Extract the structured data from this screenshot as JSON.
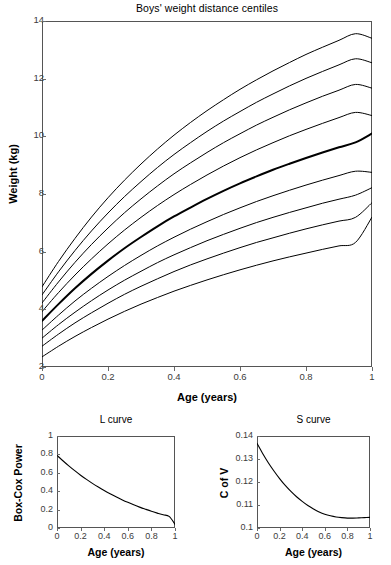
{
  "chart_data": [
    {
      "id": "main",
      "type": "line",
      "title": "Boys' weight distance centiles",
      "xlabel": "Age (years)",
      "ylabel": "Weight (kg)",
      "xlim": [
        0,
        1
      ],
      "ylim": [
        2,
        14
      ],
      "xticks": [
        0,
        0.2,
        0.4,
        0.6,
        0.8,
        1
      ],
      "xticklabels": [
        "0",
        "0.2",
        "0.4",
        "0.6",
        "0.8",
        "1"
      ],
      "yticks": [
        2,
        4,
        6,
        8,
        10,
        12,
        14
      ],
      "yticklabels": [
        "2",
        "4",
        "6",
        "8",
        "10",
        "12",
        "14"
      ],
      "grid": false,
      "legend": false,
      "x": [
        0,
        0.05,
        0.1,
        0.15,
        0.2,
        0.25,
        0.3,
        0.35,
        0.4,
        0.45,
        0.5,
        0.55,
        0.6,
        0.65,
        0.7,
        0.75,
        0.8,
        0.85,
        0.9,
        0.95,
        1
      ],
      "series": [
        {
          "name": "99.6th centile",
          "emphasis": false,
          "values": [
            4.78,
            5.66,
            6.46,
            7.2,
            7.87,
            8.48,
            9.04,
            9.56,
            10.04,
            10.48,
            10.89,
            11.27,
            11.63,
            11.96,
            12.27,
            12.56,
            12.84,
            13.09,
            13.33,
            13.56,
            13.4
          ]
        },
        {
          "name": "98th centile",
          "emphasis": false,
          "values": [
            4.5,
            5.3,
            6.04,
            6.72,
            7.34,
            7.91,
            8.43,
            8.92,
            9.37,
            9.78,
            10.17,
            10.53,
            10.86,
            11.18,
            11.47,
            11.75,
            12.01,
            12.25,
            12.48,
            12.69,
            12.55
          ]
        },
        {
          "name": "91st centile",
          "emphasis": false,
          "values": [
            4.22,
            4.95,
            5.63,
            6.25,
            6.82,
            7.35,
            7.83,
            8.28,
            8.7,
            9.08,
            9.44,
            9.78,
            10.09,
            10.39,
            10.66,
            10.92,
            11.16,
            11.39,
            11.6,
            11.8,
            11.67
          ]
        },
        {
          "name": "75th centile",
          "emphasis": false,
          "values": [
            3.92,
            4.58,
            5.19,
            5.75,
            6.27,
            6.75,
            7.19,
            7.6,
            7.98,
            8.33,
            8.66,
            8.97,
            9.26,
            9.53,
            9.78,
            10.02,
            10.24,
            10.45,
            10.65,
            10.83,
            10.72
          ]
        },
        {
          "name": "50th centile (median)",
          "emphasis": true,
          "values": [
            3.6,
            4.18,
            4.73,
            5.23,
            5.69,
            6.12,
            6.51,
            6.88,
            7.22,
            7.53,
            7.83,
            8.11,
            8.37,
            8.61,
            8.84,
            9.05,
            9.25,
            9.44,
            9.62,
            9.79,
            10.1
          ]
        },
        {
          "name": "25th centile",
          "emphasis": false,
          "values": [
            3.28,
            3.8,
            4.29,
            4.73,
            5.14,
            5.52,
            5.87,
            6.2,
            6.5,
            6.78,
            7.04,
            7.29,
            7.52,
            7.74,
            7.94,
            8.13,
            8.31,
            8.48,
            8.64,
            8.79,
            8.75
          ]
        },
        {
          "name": "9th centile",
          "emphasis": false,
          "values": [
            3.0,
            3.47,
            3.9,
            4.3,
            4.67,
            5.01,
            5.32,
            5.62,
            5.89,
            6.14,
            6.38,
            6.6,
            6.81,
            7.01,
            7.19,
            7.36,
            7.52,
            7.68,
            7.82,
            7.96,
            8.22
          ]
        },
        {
          "name": "2nd centile",
          "emphasis": false,
          "values": [
            2.72,
            3.14,
            3.53,
            3.88,
            4.21,
            4.52,
            4.8,
            5.06,
            5.31,
            5.54,
            5.75,
            5.95,
            6.14,
            6.32,
            6.48,
            6.64,
            6.79,
            6.93,
            7.06,
            7.19,
            7.7
          ]
        },
        {
          "name": "0.4th centile",
          "emphasis": false,
          "values": [
            2.35,
            2.72,
            3.06,
            3.37,
            3.66,
            3.93,
            4.18,
            4.41,
            4.63,
            4.83,
            5.02,
            5.2,
            5.37,
            5.53,
            5.68,
            5.82,
            5.95,
            6.08,
            6.2,
            6.32,
            7.2
          ]
        }
      ]
    },
    {
      "id": "l-curve",
      "type": "line",
      "title": "L curve",
      "xlabel": "Age (years)",
      "ylabel": "Box-Cox Power",
      "xlim": [
        0,
        1
      ],
      "ylim": [
        0,
        1
      ],
      "xticks": [
        0,
        0.2,
        0.4,
        0.6,
        0.8,
        1
      ],
      "xticklabels": [
        "0",
        "0.2",
        "0.4",
        "0.6",
        "0.8",
        "1"
      ],
      "yticks": [
        0,
        0.2,
        0.4,
        0.6,
        0.8,
        1
      ],
      "yticklabels": [
        "0",
        "0.2",
        "0.4",
        "0.6",
        "0.8",
        "1"
      ],
      "grid": false,
      "legend": false,
      "x": [
        0,
        0.05,
        0.1,
        0.15,
        0.2,
        0.25,
        0.3,
        0.35,
        0.4,
        0.45,
        0.5,
        0.55,
        0.6,
        0.65,
        0.7,
        0.75,
        0.8,
        0.85,
        0.9,
        0.95,
        1
      ],
      "series": [
        {
          "name": "Box-Cox power L",
          "emphasis": false,
          "values": [
            0.79,
            0.731,
            0.675,
            0.623,
            0.574,
            0.528,
            0.485,
            0.445,
            0.407,
            0.372,
            0.339,
            0.308,
            0.279,
            0.252,
            0.227,
            0.204,
            0.182,
            0.162,
            0.143,
            0.126,
            0.04
          ]
        }
      ]
    },
    {
      "id": "s-curve",
      "type": "line",
      "title": "S curve",
      "xlabel": "Age (years)",
      "ylabel": "C of V",
      "xlim": [
        0,
        1
      ],
      "ylim": [
        0.1,
        0.14
      ],
      "xticks": [
        0,
        0.2,
        0.4,
        0.6,
        0.8,
        1
      ],
      "xticklabels": [
        "0",
        "0.2",
        "0.4",
        "0.6",
        "0.8",
        "1"
      ],
      "yticks": [
        0.1,
        0.11,
        0.12,
        0.13,
        0.14
      ],
      "yticklabels": [
        "0.1",
        "0.11",
        "0.12",
        "0.13",
        "0.14"
      ],
      "grid": false,
      "legend": false,
      "x": [
        0,
        0.05,
        0.1,
        0.15,
        0.2,
        0.25,
        0.3,
        0.35,
        0.4,
        0.45,
        0.5,
        0.55,
        0.6,
        0.65,
        0.7,
        0.75,
        0.8,
        0.85,
        0.9,
        0.95,
        1
      ],
      "series": [
        {
          "name": "Coefficient of variation S",
          "emphasis": false,
          "values": [
            0.1368,
            0.1324,
            0.1284,
            0.1248,
            0.1215,
            0.1185,
            0.1159,
            0.1136,
            0.1116,
            0.1098,
            0.1083,
            0.107,
            0.106,
            0.1053,
            0.1048,
            0.1045,
            0.1043,
            0.1043,
            0.1044,
            0.1045,
            0.1046
          ]
        }
      ]
    }
  ],
  "style": {
    "line_color": "#000000",
    "frame_color": "#555555",
    "tick_text_color": "#3c3c3c",
    "background": "#ffffff"
  }
}
